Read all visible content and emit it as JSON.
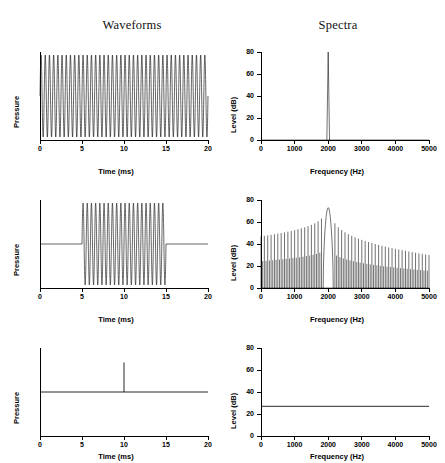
{
  "figure": {
    "columns": [
      {
        "title": "Waveforms"
      },
      {
        "title": "Spectra"
      }
    ]
  },
  "axes": {
    "time_label": "Time (ms)",
    "freq_label": "Frequency (Hz)",
    "pressure_label": "Pressure",
    "level_label": "Level (dB)",
    "time_ticks": [
      "0",
      "5",
      "10",
      "15",
      "20"
    ],
    "freq_ticks": [
      "0",
      "1000",
      "2000",
      "3000",
      "4000",
      "5000"
    ],
    "level_ticks": [
      "0",
      "20",
      "40",
      "60",
      "80"
    ]
  },
  "chart_data": [
    {
      "type": "line",
      "panel": "row1-waveform",
      "title": "Waveforms",
      "subtitle": "Continuous 2000 Hz tone",
      "xlabel": "Time (ms)",
      "ylabel": "Pressure",
      "xlim": [
        0,
        20
      ],
      "ylim": [
        -1,
        1
      ],
      "xticks": [
        0,
        5,
        10,
        15,
        20
      ],
      "yticks": [],
      "grid": false,
      "legend": null,
      "waveform": {
        "kind": "sine",
        "frequency_hz": 2000,
        "amplitude": 1,
        "onset_ms": 0,
        "offset_ms": 20,
        "cycles": 40
      }
    },
    {
      "type": "line",
      "panel": "row1-spectrum",
      "title": "Spectra",
      "subtitle": "Line spectrum of continuous tone",
      "xlabel": "Frequency (Hz)",
      "ylabel": "Level (dB)",
      "xlim": [
        0,
        5000
      ],
      "ylim": [
        0,
        80
      ],
      "xticks": [
        0,
        1000,
        2000,
        3000,
        4000,
        5000
      ],
      "yticks": [
        0,
        20,
        40,
        60,
        80
      ],
      "grid": false,
      "legend": null,
      "spectrum": {
        "kind": "single-line",
        "peak_frequency_hz": 2000,
        "peak_level_db": 80,
        "floor_level_db": 0,
        "half_width_hz": 40
      }
    },
    {
      "type": "line",
      "panel": "row2-waveform",
      "title": "",
      "subtitle": "Gated 2000 Hz tone burst, 5-15 ms",
      "xlabel": "Time (ms)",
      "ylabel": "Pressure",
      "xlim": [
        0,
        20
      ],
      "ylim": [
        -1,
        1
      ],
      "xticks": [
        0,
        5,
        10,
        15,
        20
      ],
      "yticks": [],
      "grid": false,
      "legend": null,
      "waveform": {
        "kind": "tone-burst",
        "frequency_hz": 2000,
        "amplitude": 1,
        "onset_ms": 5,
        "offset_ms": 15,
        "cycles": 20
      }
    },
    {
      "type": "line",
      "panel": "row2-spectrum",
      "title": "",
      "subtitle": "Sinc-shaped spectrum of gated tone",
      "xlabel": "Frequency (Hz)",
      "ylabel": "Level (dB)",
      "xlim": [
        0,
        5000
      ],
      "ylim": [
        0,
        80
      ],
      "xticks": [
        0,
        1000,
        2000,
        3000,
        4000,
        5000
      ],
      "yticks": [
        0,
        20,
        40,
        60,
        80
      ],
      "grid": false,
      "legend": null,
      "spectrum": {
        "kind": "sinc-lobes",
        "center_frequency_hz": 2000,
        "peak_level_db": 73,
        "mainlobe_half_width_hz": 100,
        "sidelobe_spacing_hz": 100,
        "sidelobe_level_at_0hz_db": 43,
        "sidelobe_level_at_5000hz_db": 30,
        "sidelobe_minimum_db": 0
      }
    },
    {
      "type": "line",
      "panel": "row3-waveform",
      "title": "",
      "subtitle": "Single click (impulse) at 10 ms",
      "xlabel": "Time (ms)",
      "ylabel": "Pressure",
      "xlim": [
        0,
        20
      ],
      "ylim": [
        -1,
        1
      ],
      "xticks": [
        0,
        5,
        10,
        15,
        20
      ],
      "yticks": [],
      "grid": false,
      "legend": null,
      "waveform": {
        "kind": "impulse",
        "impulse_time_ms": 10,
        "amplitude": 0.72,
        "baseline": 0
      }
    },
    {
      "type": "line",
      "panel": "row3-spectrum",
      "title": "",
      "subtitle": "Flat spectrum of click",
      "xlabel": "Frequency (Hz)",
      "ylabel": "Level (dB)",
      "xlim": [
        0,
        5000
      ],
      "ylim": [
        0,
        80
      ],
      "xticks": [
        0,
        1000,
        2000,
        3000,
        4000,
        5000
      ],
      "yticks": [
        0,
        20,
        40,
        60,
        80
      ],
      "grid": false,
      "legend": null,
      "spectrum": {
        "kind": "flat",
        "level_db": 27,
        "start_frequency_hz": 0,
        "end_frequency_hz": 5000
      }
    }
  ]
}
